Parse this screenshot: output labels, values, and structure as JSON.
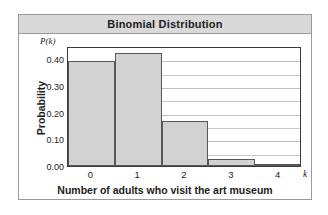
{
  "card": {
    "title": "Binomial Distribution"
  },
  "chart_data": {
    "type": "bar",
    "title": "Binomial Distribution",
    "xlabel": "Number of adults who visit the art museum",
    "ylabel": "Probability",
    "y_axis_symbol": "P(k)",
    "x_axis_symbol": "k",
    "categories": [
      "0",
      "1",
      "2",
      "3",
      "4"
    ],
    "values": [
      0.394,
      0.422,
      0.167,
      0.027,
      0.002
    ],
    "ylim": [
      0.0,
      0.45
    ],
    "xlim": [
      -0.5,
      4.5
    ],
    "ytick_labels": [
      "0.00",
      "0.10",
      "0.20",
      "0.30",
      "0.40"
    ],
    "ytick_values": [
      0.0,
      0.1,
      0.2,
      0.3,
      0.4
    ],
    "xtick_labels": [
      "0",
      "1",
      "2",
      "3",
      "4"
    ],
    "grid": "horizontal",
    "gridline_step": 0.05,
    "legend": "none",
    "bar_fill_color": "#d2d2d2",
    "bar_edge_color": "#575757",
    "header_color": "#d9d9d9",
    "border_color": "#9a9a9a",
    "gridline_color": "#c9c9c9"
  }
}
